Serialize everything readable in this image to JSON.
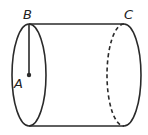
{
  "diagram": {
    "type": "cylinder",
    "labels": {
      "A": "A",
      "B": "B",
      "C": "C"
    },
    "stroke_color": "#2a2a2a",
    "elements": {
      "left_face": "ellipse (front circular base)",
      "right_face": "half-ellipse solid outer edge with dashed hidden inner edge",
      "radius_segment": "line from B (top of left base) to A (center of left base)"
    }
  }
}
